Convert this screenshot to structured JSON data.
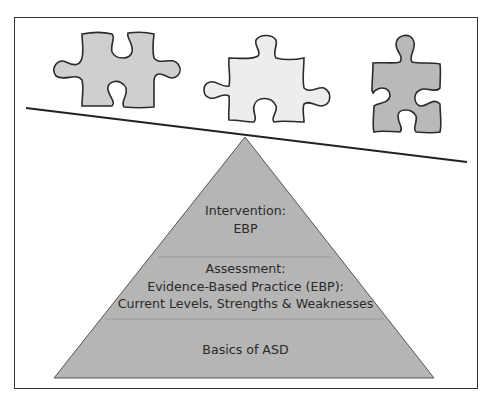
{
  "diagram": {
    "type": "pyramid-with-puzzle-pieces",
    "puzzle_pieces": [
      {
        "name": "left-piece",
        "fill": "#cfcfcf"
      },
      {
        "name": "middle-piece",
        "fill": "#ececec"
      },
      {
        "name": "right-piece",
        "fill": "#b8b8b8"
      }
    ],
    "pyramid": {
      "fill": "#b4b4b4",
      "levels": [
        {
          "position": "top",
          "lines": [
            "Intervention:",
            "EBP"
          ]
        },
        {
          "position": "middle",
          "lines": [
            "Assessment:",
            "Evidence-Based Practice (EBP):",
            "Current Levels, Strengths & Weaknesses"
          ]
        },
        {
          "position": "bottom",
          "lines": [
            "Basics of ASD"
          ]
        }
      ]
    },
    "colors": {
      "stroke": "#2b2b2b",
      "divider": "#9a9a9a"
    }
  }
}
